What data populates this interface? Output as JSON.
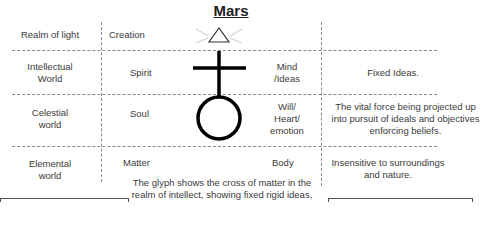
{
  "title": "Mars",
  "rows": [
    {
      "realm": "Realm of light",
      "aspect": "Creation",
      "faculty": "",
      "meaning": ""
    },
    {
      "realm": "Intellectual World",
      "realm_lines": [
        "Intellectual",
        "World"
      ],
      "aspect": "Spirit",
      "faculty_lines": [
        "Mind",
        "/Ideas"
      ],
      "meaning": "Fixed Ideas."
    },
    {
      "realm": "Celestial world",
      "realm_lines": [
        "Celestial",
        "world"
      ],
      "aspect": "Soul",
      "faculty_lines": [
        "Will/",
        "Heart/",
        "emotion"
      ],
      "meaning_lines": [
        "The vital force being projected up",
        "into pursuit of ideals and objectives",
        "enforcing beliefs."
      ]
    },
    {
      "realm": "Elemental world",
      "realm_lines": [
        "Elemental",
        "world"
      ],
      "aspect": "Matter",
      "faculty": "Body",
      "meaning_lines": [
        "Insensitive to surroundings",
        "and nature."
      ]
    }
  ],
  "glyph": {
    "name": "Mars glyph",
    "parts": [
      "triangle",
      "cross",
      "circle"
    ],
    "stroke_color": "#000000"
  },
  "description_lines": [
    "The glyph shows the cross of matter in the",
    "realm of intellect, showing fixed rigid ideas,"
  ],
  "colors": {
    "dashed_line": "#8a8a8a",
    "text": "#3a3a3a",
    "glyph": "#000000",
    "rays": "#dddddd"
  }
}
